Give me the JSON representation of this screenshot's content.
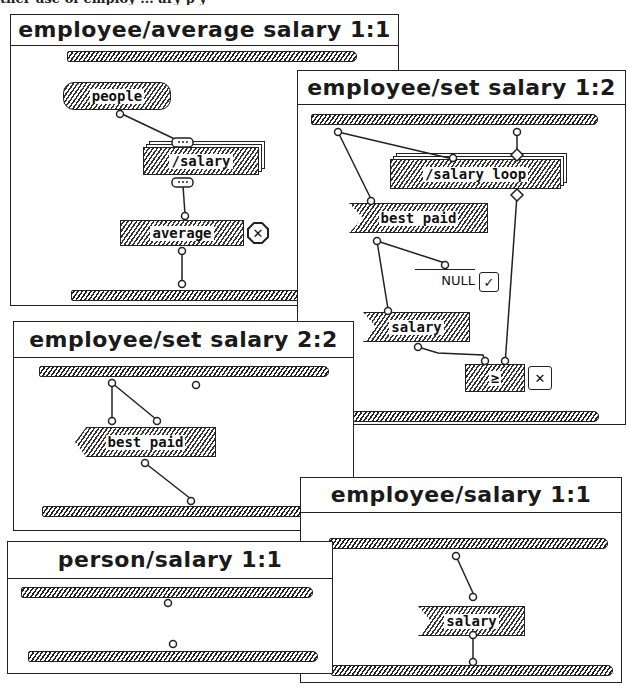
{
  "caption_fragment": "ther use of employ   ... ary     p          y",
  "windows": [
    {
      "id": "w1",
      "title": "employee/average salary 1:1",
      "operations": [
        {
          "name": "people",
          "shape": "rounded"
        },
        {
          "name": "/salary",
          "shape": "list-multiplex"
        },
        {
          "name": "average",
          "shape": "rect",
          "control": "fail-octagon",
          "control_glyph": "✕"
        }
      ],
      "list_terminal_glyph": "(···)"
    },
    {
      "id": "w2",
      "title": "employee/set salary 1:2",
      "operations": [
        {
          "name": "/salary loop",
          "shape": "loop-multiplex"
        },
        {
          "name": "best paid",
          "shape": "get"
        },
        {
          "name": "salary",
          "shape": "get"
        },
        {
          "name": "≥",
          "shape": "rect",
          "control": "next-case-on-failure",
          "control_glyph": "✕"
        }
      ],
      "constant": {
        "value": "NULL",
        "control_glyph": "✓"
      },
      "loop_terminal_glyph": "◊"
    },
    {
      "id": "w3",
      "title": "employee/set salary 2:2",
      "operations": [
        {
          "name": "best paid",
          "shape": "set"
        }
      ]
    },
    {
      "id": "w4",
      "title": "employee/salary 1:1",
      "operations": [
        {
          "name": "salary",
          "shape": "get"
        }
      ]
    },
    {
      "id": "w5",
      "title": "person/salary 1:1",
      "operations": []
    }
  ]
}
